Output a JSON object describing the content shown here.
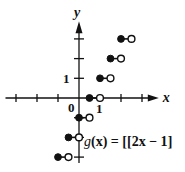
{
  "chart_data": {
    "type": "scatter",
    "subtype": "step-function",
    "title": "",
    "function_label": "g(x) = [[2x − 1]]",
    "function_label_parts": {
      "name": "g",
      "arg": "(x)",
      "eq": " = ",
      "open_bracket": "[[",
      "expr": "2x − 1",
      "close_bracket": "]"
    },
    "xlabel": "x",
    "ylabel": "y",
    "origin_label": "0",
    "x_tick_label": "1",
    "y_tick_label": "1",
    "xlim": [
      -3.5,
      3.8
    ],
    "ylim": [
      -3.3,
      3.9
    ],
    "x_ticks": [
      -3,
      -2,
      -1,
      1,
      2,
      3
    ],
    "y_ticks": [
      -3,
      -2,
      -1,
      1,
      2,
      3
    ],
    "grid": false,
    "legend": "none",
    "segments": [
      {
        "x_start": -1.0,
        "x_end": -0.5,
        "y": -3,
        "start_closed": true,
        "end_closed": false
      },
      {
        "x_start": -0.5,
        "x_end": 0.0,
        "y": -2,
        "start_closed": true,
        "end_closed": false
      },
      {
        "x_start": 0.0,
        "x_end": 0.5,
        "y": -1,
        "start_closed": true,
        "end_closed": false
      },
      {
        "x_start": 0.5,
        "x_end": 1.0,
        "y": 0,
        "start_closed": true,
        "end_closed": false
      },
      {
        "x_start": 1.0,
        "x_end": 1.5,
        "y": 1,
        "start_closed": true,
        "end_closed": false
      },
      {
        "x_start": 1.5,
        "x_end": 2.0,
        "y": 2,
        "start_closed": true,
        "end_closed": false
      },
      {
        "x_start": 2.0,
        "x_end": 2.5,
        "y": 3,
        "start_closed": true,
        "end_closed": false
      }
    ]
  },
  "layout": {
    "origin_px": [
      79,
      98
    ],
    "x_unit_px": 21,
    "y_unit_px": 19.7
  },
  "colors": {
    "ink": "#111111",
    "background": "#ffffff"
  }
}
